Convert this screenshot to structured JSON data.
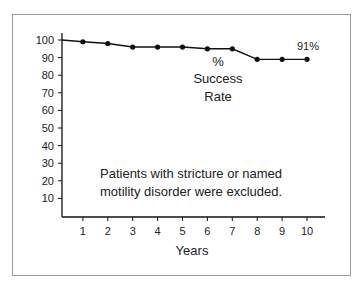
{
  "chart_data": {
    "type": "line",
    "title": "",
    "xlabel": "Years",
    "ylabel": "% Success Rate",
    "x": [
      0,
      1,
      2,
      3,
      4,
      5,
      6,
      7,
      8,
      9,
      10
    ],
    "series": [
      {
        "name": "% Success Rate",
        "values": [
          100,
          99,
          98,
          96,
          96,
          96,
          95,
          95,
          89,
          89,
          89
        ]
      }
    ],
    "x_ticks": [
      "1",
      "2",
      "3",
      "4",
      "5",
      "6",
      "7",
      "8",
      "9",
      "10"
    ],
    "y_ticks": [
      "100",
      "90",
      "80",
      "70",
      "60",
      "50",
      "40",
      "30",
      "20",
      "10"
    ],
    "ylim": [
      0,
      100
    ],
    "xlim": [
      0,
      10.8
    ],
    "grid": false,
    "legend": "none",
    "annotations": {
      "end_label": "91%",
      "series_label_line1": "%",
      "series_label_line2": "Success",
      "series_label_line3": "Rate",
      "note_line1": "Patients with stricture or named",
      "note_line2": "motility disorder were excluded."
    }
  },
  "colors": {
    "line": "#111111",
    "frame": "#9a9a9a",
    "text": "#222222"
  }
}
